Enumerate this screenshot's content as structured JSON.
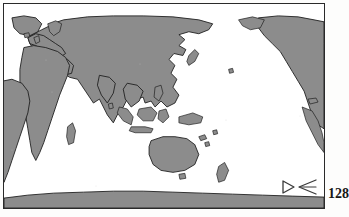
{
  "page": {
    "page_number": "128",
    "background_color": "#fdfdfc"
  },
  "figure": {
    "type": "world-map",
    "projection": "cylindrical-equidistant",
    "center_longitude": 150,
    "frame_color": "#2a2a2a",
    "ocean_color": "#ffffff",
    "land_fill_color": "#8c8c8c",
    "land_outline_color": "#1f1f1f",
    "graticule_visible": false,
    "labels_visible": false,
    "landmasses": [
      "North America",
      "South America",
      "Greenland",
      "Europe",
      "Africa",
      "Asia",
      "Australia",
      "New Zealand",
      "Indonesia",
      "Papua New Guinea",
      "Japan",
      "Madagascar",
      "Antarctica"
    ]
  },
  "legend": {
    "glyph_name": "triangle-arrow-marker",
    "glyph_color": "#3a3a3a",
    "label": ""
  }
}
